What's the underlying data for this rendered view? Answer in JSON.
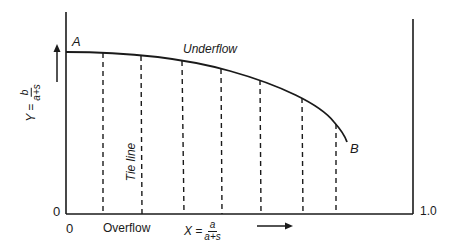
{
  "diagram": {
    "type": "phase-diagram",
    "curve_label": "Underflow",
    "point_start": "A",
    "point_end": "B",
    "tie_line_label": "Tie line",
    "overflow_label": "Overflow",
    "y_axis": {
      "var": "Y =",
      "numerator": "b",
      "denominator": "a+s",
      "origin_label": "0"
    },
    "x_axis": {
      "var": "X =",
      "numerator": "a",
      "denominator": "a+s",
      "origin_label": "0",
      "max_label": "1.0"
    },
    "tie_line_count": 7,
    "colors": {
      "ink": "#1a1a1a",
      "background": "#ffffff"
    }
  }
}
